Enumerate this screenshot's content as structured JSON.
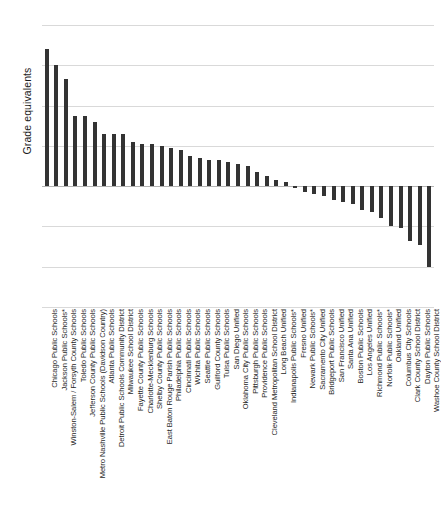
{
  "chart_data": {
    "type": "bar",
    "title": "",
    "xlabel": "",
    "ylabel": "Grade equivalents",
    "ylim": [
      -0.6,
      0.8
    ],
    "yticks": [
      0.8,
      0.6,
      0.4,
      0.2,
      0,
      -0.2,
      -0.4,
      -0.6
    ],
    "ytick_labels": [
      "0.8",
      "0.6",
      "0.4",
      "0.2",
      "0",
      "–0.2",
      "–0.4",
      "–0.6"
    ],
    "grid": true,
    "legend": null,
    "bar_color": "#333333",
    "categories": [
      "Chicago Public Schools",
      "Jackson Public Schools*",
      "Winston-Salem / Forsyth County Schools",
      "Toledo Public Schools",
      "Jefferson County Public Schools",
      "Metro Nashville Public Schools (Davidson Country)",
      "Atlanta Public Schools",
      "Detroit Public Schools Community District",
      "Milwaukee School District",
      "Fayette County Public Schools",
      "Charlotte-Mecklenburg Schools",
      "Shelby County Public Schools",
      "East Baton Rouge Parish Public Schools",
      "Philadelphia Public Schools",
      "Cincinnati Public Schools",
      "Wichita Public Schools",
      "Seattle Public Schools",
      "Guilford County Schools",
      "Tulsa Public Schools",
      "San Diego Unified",
      "Oklahoma City Public Schools",
      "Pittsburgh Public Schools",
      "Providence Public Schools",
      "Cleveland Metropolitan School District",
      "Long Beach Unified",
      "Indianapolis Public Schools*",
      "Fresno Unified",
      "Newark Public Schools*",
      "Sacramento City Unified",
      "Bridgeport Public Schools",
      "San Francisco Unified",
      "Santa Ana Unified",
      "Boston Public Schools",
      "Los Angeles Unified",
      "Richmond Public Schools*",
      "Norfolk Public Schools*",
      "Oakland Unified",
      "Columbus City Schools",
      "Clark County School District",
      "Dayton Public Schools",
      "Washoe County School District"
    ],
    "values": [
      0.68,
      0.6,
      0.53,
      0.35,
      0.35,
      0.32,
      0.26,
      0.26,
      0.26,
      0.22,
      0.21,
      0.21,
      0.2,
      0.19,
      0.18,
      0.15,
      0.14,
      0.13,
      0.13,
      0.12,
      0.11,
      0.1,
      0.07,
      0.05,
      0.03,
      0.02,
      -0.01,
      -0.03,
      -0.04,
      -0.05,
      -0.07,
      -0.08,
      -0.09,
      -0.12,
      -0.13,
      -0.16,
      -0.2,
      -0.21,
      -0.27,
      -0.29,
      -0.4
    ]
  }
}
